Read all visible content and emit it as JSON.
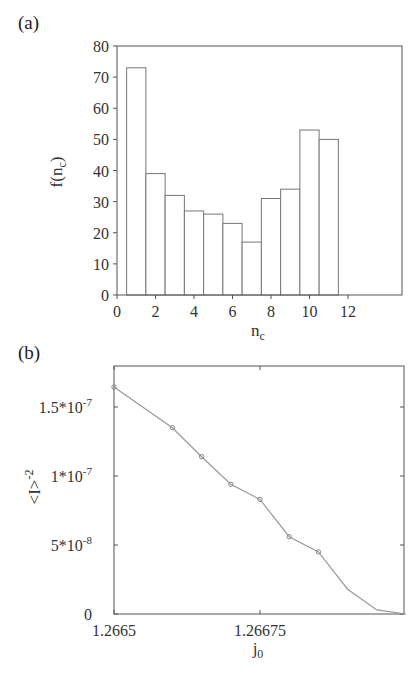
{
  "chart_data": [
    {
      "panel": "(a)",
      "type": "bar",
      "subtype": "histogram",
      "categories": [
        1,
        2,
        3,
        4,
        5,
        6,
        7,
        8,
        9,
        10,
        11
      ],
      "values": [
        73,
        39,
        32,
        27,
        26,
        23,
        17,
        31,
        34,
        53,
        50
      ],
      "xlabel": "n_c",
      "ylabel": "f(n_c)",
      "xlim": [
        0,
        15
      ],
      "ylim": [
        0,
        80
      ],
      "xticks": [
        0,
        2,
        4,
        6,
        8,
        10,
        12
      ],
      "yticks": [
        0,
        10,
        20,
        30,
        40,
        50,
        60,
        70,
        80
      ],
      "grid": false,
      "legend": null
    },
    {
      "panel": "(b)",
      "type": "line",
      "x": [
        1.2665,
        1.2666,
        1.26665,
        1.2667,
        1.26675,
        1.2668,
        1.26685,
        1.2669,
        1.26695,
        1.267
      ],
      "y": [
        1.645e-07,
        1.35e-07,
        1.14e-07,
        9.4e-08,
        8.3e-08,
        5.6e-08,
        4.5e-08,
        1.8e-08,
        3e-09,
        0.0
      ],
      "markers_on": [
        true,
        true,
        true,
        true,
        true,
        true,
        true,
        false,
        false,
        false
      ],
      "xlabel": "j_0",
      "ylabel": "<I>^-2",
      "xlim": [
        1.2665,
        1.267
      ],
      "ylim": [
        0,
        1.8e-07
      ],
      "xticks": [
        "1.2665",
        "1.26675"
      ],
      "yticks": [
        "0",
        "5*10^-8",
        "1*10^-7",
        "1.5*10^-7"
      ],
      "grid": false,
      "legend": null
    }
  ],
  "panel_a": {
    "label": "(a)",
    "ylabel_main": "f(n",
    "ylabel_sub": "c",
    "ylabel_close": ")",
    "xlabel_main": "n",
    "xlabel_sub": "c",
    "ytick_labels": [
      "0",
      "10",
      "20",
      "30",
      "40",
      "50",
      "60",
      "70",
      "80"
    ],
    "xtick_labels": [
      "0",
      "2",
      "4",
      "6",
      "8",
      "10",
      "12"
    ]
  },
  "panel_b": {
    "label": "(b)",
    "ylabel_main": "<I>",
    "ylabel_sup": "-2",
    "xlabel_main": "j",
    "xlabel_sub": "0",
    "ytick_labels": [
      {
        "base": "0",
        "exp": ""
      },
      {
        "base": "5*10",
        "exp": "-8"
      },
      {
        "base": "1*10",
        "exp": "-7"
      },
      {
        "base": "1.5*10",
        "exp": "-7"
      }
    ],
    "xtick_labels": [
      "1.2665",
      "1.26675"
    ]
  },
  "colors": {
    "axis": "#555555",
    "bar_edge": "#777777",
    "line": "#999999",
    "marker": "#888888"
  }
}
